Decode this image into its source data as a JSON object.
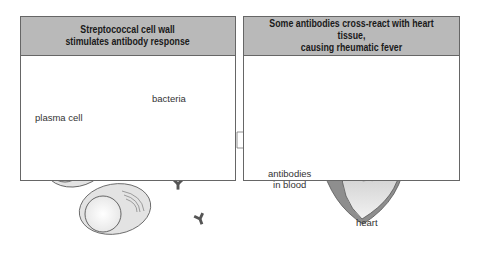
{
  "panels": {
    "left": {
      "title": "Streptococcal cell wall\nstimulates antibody response",
      "labels": {
        "bacteria": "bacteria",
        "plasma_cell": "plasma cell"
      }
    },
    "right": {
      "title": "Some antibodies cross-react with heart tissue,\ncausing rheumatic fever",
      "labels": {
        "antibodies": "antibodies\nin blood",
        "heart": "heart"
      }
    }
  },
  "colors": {
    "header_bg": "#b9b9b9",
    "bacteria_fill": "#9a9a9a",
    "antibody_dark": "#555555",
    "antibody_light": "#dcdcdc",
    "heart_fill": "#8e8e8e",
    "cell_fill": "#e3e3e3"
  }
}
